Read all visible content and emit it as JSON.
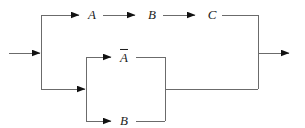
{
  "page": {
    "background": "#ffffff"
  },
  "diagram": {
    "line_color": "#6b6b6b",
    "arrow_color": "#121212",
    "label_color": "#1c1c1c",
    "labels": {
      "series_1": "A",
      "series_2": "B",
      "series_3": "C",
      "parallel_top": "A",
      "parallel_top_overline": true,
      "parallel_bottom": "B"
    }
  }
}
